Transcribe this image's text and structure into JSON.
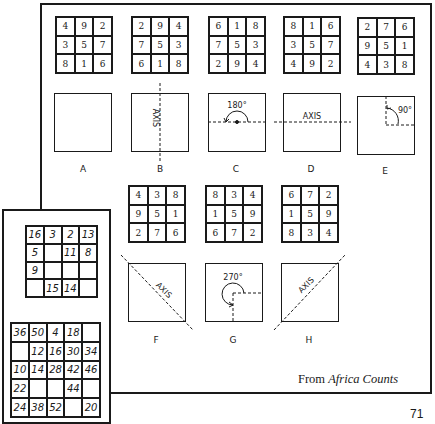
{
  "figure": {
    "row1": [
      {
        "label": "A",
        "grid": [
          [
            4,
            9,
            2
          ],
          [
            3,
            5,
            7
          ],
          [
            8,
            1,
            6
          ]
        ],
        "transform": "identity",
        "annotation": ""
      },
      {
        "label": "B",
        "grid": [
          [
            2,
            9,
            4
          ],
          [
            7,
            5,
            3
          ],
          [
            6,
            1,
            8
          ]
        ],
        "transform": "vertical-axis-reflection",
        "annotation": "AXIS"
      },
      {
        "label": "C",
        "grid": [
          [
            6,
            1,
            8
          ],
          [
            7,
            5,
            3
          ],
          [
            2,
            9,
            4
          ]
        ],
        "transform": "rotation",
        "annotation": "180°"
      },
      {
        "label": "D",
        "grid": [
          [
            8,
            1,
            6
          ],
          [
            3,
            5,
            7
          ],
          [
            4,
            9,
            2
          ]
        ],
        "transform": "horizontal-axis-reflection",
        "annotation": "AXIS"
      },
      {
        "label": "E",
        "grid": [
          [
            2,
            7,
            6
          ],
          [
            9,
            5,
            1
          ],
          [
            4,
            3,
            8
          ]
        ],
        "transform": "rotation",
        "annotation": "90°"
      }
    ],
    "row2": [
      {
        "label": "F",
        "grid": [
          [
            4,
            3,
            8
          ],
          [
            9,
            5,
            1
          ],
          [
            2,
            7,
            6
          ]
        ],
        "transform": "diagonal-reflection",
        "annotation": "AXIS"
      },
      {
        "label": "G",
        "grid": [
          [
            8,
            3,
            4
          ],
          [
            1,
            5,
            9
          ],
          [
            6,
            7,
            2
          ]
        ],
        "transform": "rotation",
        "annotation": "270°"
      },
      {
        "label": "H",
        "grid": [
          [
            6,
            7,
            2
          ],
          [
            1,
            5,
            9
          ],
          [
            8,
            3,
            4
          ]
        ],
        "transform": "anti-diagonal-reflection",
        "annotation": "AXIS"
      }
    ],
    "caption_prefix": "From ",
    "caption_title": "Africa Counts"
  },
  "inset": {
    "grid4": [
      [
        "16",
        "3",
        "2",
        "13"
      ],
      [
        "5",
        "",
        "11",
        "8"
      ],
      [
        "9",
        "",
        "",
        ""
      ],
      [
        "",
        "15",
        "14",
        ""
      ]
    ],
    "grid5": [
      [
        "36",
        "50",
        "4",
        "18",
        ""
      ],
      [
        "",
        "12",
        "16",
        "30",
        "34"
      ],
      [
        "10",
        "14",
        "28",
        "42",
        "46"
      ],
      [
        "22",
        "",
        "",
        "44",
        ""
      ],
      [
        "24",
        "38",
        "52",
        "",
        "20"
      ]
    ]
  },
  "page_number": "71"
}
